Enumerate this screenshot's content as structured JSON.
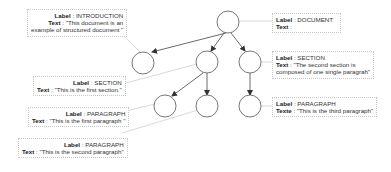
{
  "nodes": {
    "document": {
      "label_key": "Label",
      "label": "DOCUMENT",
      "text_key": "Text",
      "text": ""
    },
    "introduction": {
      "label_key": "Label",
      "label": "INTRODUCTION",
      "text_key": "Text",
      "text": "\"This document is an",
      "text2": "example of structured document \""
    },
    "section1": {
      "label_key": "Label",
      "label": "SECTION",
      "text_key": "Text",
      "text": "\"This is the first section.\""
    },
    "section2": {
      "label_key": "Label",
      "label": "SECTION",
      "text_key": "Text",
      "text": "\"The second section is",
      "text2": "composed of one single paragrah\""
    },
    "paragraph1": {
      "label_key": "Label",
      "label": "PARAGRAPH",
      "text_key": "Text",
      "text": "\"This is the first paragraph \""
    },
    "paragraph2": {
      "label_key": "Label",
      "label": "PARAGRAPH",
      "text_key": "Text",
      "text": "\"This is the second paragraph\""
    },
    "paragraph3": {
      "label_key": "Label",
      "label": "PARAGRAPH",
      "text_key": "Texte",
      "text": "\"This is the third paragraph\""
    }
  },
  "colors": {
    "node_stroke": "#555555",
    "edge": "#444444",
    "leader": "#cccccc",
    "box_border": "#c8c8c8"
  }
}
